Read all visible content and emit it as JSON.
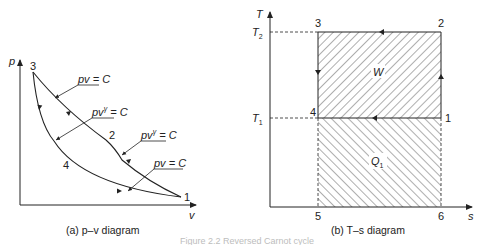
{
  "figure_caption": "Figure 2.2  Reversed Carnot cycle",
  "pv_diagram": {
    "caption": "(a) p–v diagram",
    "axis_y": "p",
    "axis_x": "v",
    "points": {
      "p1": "1",
      "p2": "2",
      "p3": "3",
      "p4": "4"
    },
    "annotations": [
      {
        "id": "ann_top_isothermal",
        "text_base": "pv",
        "text_sup": "",
        "text_rest": " = C"
      },
      {
        "id": "ann_left_adiabatic",
        "text_base": "pv",
        "text_sup": "γ",
        "text_rest": " = C"
      },
      {
        "id": "ann_right_adiabatic",
        "text_base": "pv",
        "text_sup": "γ",
        "text_rest": " = C"
      },
      {
        "id": "ann_bottom_isothermal",
        "text_base": "pv",
        "text_sup": "",
        "text_rest": " = C"
      }
    ],
    "processes": [
      {
        "from": "1",
        "to": "2",
        "type": "adiabatic compression",
        "label": "pv^γ = C"
      },
      {
        "from": "2",
        "to": "3",
        "type": "isothermal compression",
        "label": "pv = C"
      },
      {
        "from": "3",
        "to": "4",
        "type": "adiabatic expansion",
        "label": "pv^γ = C"
      },
      {
        "from": "4",
        "to": "1",
        "type": "isothermal expansion",
        "label": "pv = C"
      }
    ]
  },
  "ts_diagram": {
    "caption": "(b) T–s diagram",
    "axis_y": "T",
    "axis_x": "s",
    "t2_label": "T",
    "t2_sub": "2",
    "t1_label": "T",
    "t1_sub": "1",
    "points": {
      "p1": "1",
      "p2": "2",
      "p3": "3",
      "p4": "4",
      "p5": "5",
      "p6": "6"
    },
    "work_label": "W",
    "heat_label": "Q",
    "heat_sub": "1"
  }
}
